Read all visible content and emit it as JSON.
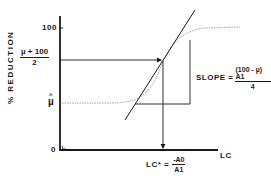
{
  "diagram": {
    "y_axis": {
      "label": "% REDUCTION",
      "ticks": {
        "top": "100",
        "zero": "0"
      },
      "midlevel": {
        "numerator": "µ + 100",
        "denominator": "2"
      },
      "lower_asymptote": "µ"
    },
    "x_axis": {
      "label": "LC"
    },
    "slope_annotation": {
      "prefix": "SLOPE =",
      "numerator": "(100 - µ) A1",
      "denominator": "4"
    },
    "lc_star_annotation": {
      "prefix": "LC* =",
      "numerator": "-A0",
      "denominator": "A1"
    },
    "colors": {
      "ink": "#1a1a1a",
      "curve": "#9a9a9a",
      "background": "#ffffff"
    }
  }
}
